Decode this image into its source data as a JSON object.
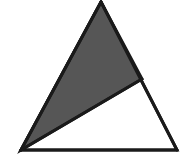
{
  "figure": {
    "name": "shaded-triangle-figure",
    "type": "geometric-diagram",
    "canvas": {
      "width": 184,
      "height": 156,
      "background_color": "#ffffff"
    },
    "colors": {
      "background": "#ffffff",
      "outline": "#1a1a1a",
      "shaded_fill": "#565656",
      "unshaded_fill": "#ffffff",
      "texture_line": "#4a4a4a"
    },
    "points": {
      "apex": {
        "label": "apex",
        "x": 101,
        "y": 2
      },
      "bottom_left": {
        "label": "bottom-left",
        "x": 21,
        "y": 150
      },
      "bottom_right": {
        "label": "bottom-right",
        "x": 177,
        "y": 150
      },
      "right_edge_point": {
        "label": "right-edge-point",
        "x": 142,
        "y": 79
      }
    },
    "shapes": [
      {
        "name": "outer-triangle",
        "kind": "triangle",
        "fill": "#ffffff",
        "stroke": "#1a1a1a",
        "stroke_width": 3,
        "vertices": "101,2 177,150 21,150"
      },
      {
        "name": "shaded-triangle",
        "kind": "triangle",
        "fill": "#565656",
        "stroke": "#1a1a1a",
        "stroke_width": 3,
        "shaded": true,
        "vertices": "101,2 142,79 21,150"
      }
    ],
    "segments": [
      {
        "name": "left-edge",
        "from": "apex",
        "to": "bottom_left"
      },
      {
        "name": "base-edge",
        "from": "bottom_left",
        "to": "bottom_right"
      },
      {
        "name": "right-edge",
        "from": "apex",
        "to": "bottom_right"
      },
      {
        "name": "cevian-inner-diagonal",
        "from": "bottom_left",
        "to": "right_edge_point"
      },
      {
        "name": "upper-right-edge-segment",
        "from": "apex",
        "to": "right_edge_point"
      }
    ],
    "texture": {
      "pattern": "fine-crosshatch",
      "spacing": 3,
      "opacity": 0.22
    }
  }
}
